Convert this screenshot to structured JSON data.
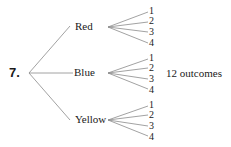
{
  "problem_number": "7.",
  "tree": {
    "colors": [
      {
        "label": "Red",
        "outcomes": [
          "1",
          "2",
          "3",
          "4"
        ]
      },
      {
        "label": "Blue",
        "outcomes": [
          "1",
          "2",
          "3",
          "4"
        ]
      },
      {
        "label": "Yellow",
        "outcomes": [
          "1",
          "2",
          "3",
          "4"
        ]
      }
    ]
  },
  "summary": "12 outcomes",
  "line_color": "#8a8a8a"
}
